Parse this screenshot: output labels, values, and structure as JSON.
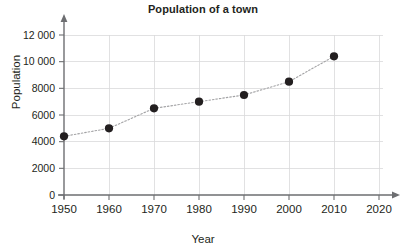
{
  "chart_data": {
    "type": "line",
    "title": "Population of a town",
    "xlabel": "Year",
    "ylabel": "Population",
    "x": [
      1950,
      1960,
      1970,
      1980,
      1990,
      2000,
      2010
    ],
    "values": [
      4400,
      5000,
      6500,
      7000,
      7500,
      8500,
      10400
    ],
    "series": [
      {
        "name": "Population",
        "values": [
          4400,
          5000,
          6500,
          7000,
          7500,
          8500,
          10400
        ]
      }
    ],
    "xlim": [
      1950,
      2020
    ],
    "ylim": [
      0,
      12000
    ],
    "x_ticks": [
      1950,
      1960,
      1970,
      1980,
      1990,
      2000,
      2010,
      2020
    ],
    "x_tick_labels": [
      "1950",
      "1960",
      "1970",
      "1980",
      "1990",
      "2000",
      "2010",
      "2020"
    ],
    "y_ticks": [
      0,
      2000,
      4000,
      6000,
      8000,
      10000,
      12000
    ],
    "y_tick_labels": [
      "0",
      "2000",
      "4000",
      "6000",
      "8000",
      "10 000",
      "12 000"
    ],
    "grid": true,
    "legend": false,
    "marker": "filled-circle",
    "line_style": "dotted",
    "colors": {
      "marker": "#231f20",
      "line": "#a3a3a5",
      "grid": "#d9dadb",
      "axis": "#6d6e71",
      "text": "#231f20",
      "background": "#ffffff"
    }
  }
}
